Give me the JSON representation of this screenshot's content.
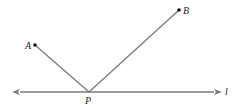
{
  "diagram": {
    "points": {
      "A": {
        "label": "A",
        "x": 35,
        "y": 45
      },
      "B": {
        "label": "B",
        "x": 179,
        "y": 10
      },
      "P": {
        "label": "P",
        "x": 89,
        "y": 92
      }
    },
    "line": {
      "label": "l",
      "y": 92,
      "x_start": 12,
      "x_end": 222
    },
    "colors": {
      "line": "#7a7a7a",
      "point": "#111111",
      "text": "#222222"
    }
  }
}
